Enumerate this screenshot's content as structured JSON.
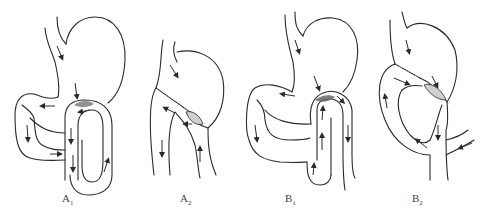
{
  "figure": {
    "panels": [
      {
        "id": "A1",
        "label": "A",
        "subscript": "1",
        "description": "Antecolic gastrojejunostomy with afferent loop adjacent, stomach with jejunal loop"
      },
      {
        "id": "A2",
        "label": "A",
        "subscript": "2",
        "description": "Partial gastrectomy with sutured remnant and anastomosis"
      },
      {
        "id": "B1",
        "label": "B",
        "subscript": "1",
        "description": "Gastrojejunostomy variant with jejunal loop"
      },
      {
        "id": "B2",
        "label": "B",
        "subscript": "2",
        "description": "Partial gastrectomy with sutured remnant and looped jejunal anastomosis"
      }
    ],
    "colors": {
      "line": "#2a2a2a",
      "background": "#ffffff",
      "shading": "#777777"
    }
  }
}
